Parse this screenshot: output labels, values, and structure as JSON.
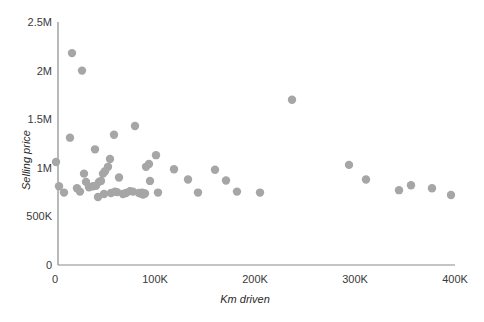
{
  "chart_data": {
    "type": "scatter",
    "title": "",
    "xlabel": "Km driven",
    "ylabel": "Selling price",
    "xlim": [
      0,
      400000
    ],
    "ylim": [
      0,
      2500000
    ],
    "grid": false,
    "legend": null,
    "marker_color": "#a6a6a6",
    "axis_color": "#8a8a8a",
    "xticks": [
      {
        "value": 0,
        "label": "0"
      },
      {
        "value": 100000,
        "label": "100K"
      },
      {
        "value": 200000,
        "label": "200K"
      },
      {
        "value": 300000,
        "label": "300K"
      },
      {
        "value": 400000,
        "label": "400K"
      }
    ],
    "yticks": [
      {
        "value": 0,
        "label": "0"
      },
      {
        "value": 500000,
        "label": "500K"
      },
      {
        "value": 1000000,
        "label": "1M"
      },
      {
        "value": 1500000,
        "label": "1.5M"
      },
      {
        "value": 2000000,
        "label": "2M"
      },
      {
        "value": 2500000,
        "label": "2.5M"
      }
    ],
    "points": [
      {
        "x": 1000,
        "y": 1060000
      },
      {
        "x": 4000,
        "y": 810000
      },
      {
        "x": 9000,
        "y": 745000
      },
      {
        "x": 17000,
        "y": 2180000
      },
      {
        "x": 15000,
        "y": 1310000
      },
      {
        "x": 27000,
        "y": 2000000
      },
      {
        "x": 22000,
        "y": 790000
      },
      {
        "x": 25000,
        "y": 755000
      },
      {
        "x": 29000,
        "y": 940000
      },
      {
        "x": 31000,
        "y": 855000
      },
      {
        "x": 34000,
        "y": 800000
      },
      {
        "x": 38000,
        "y": 810000
      },
      {
        "x": 41000,
        "y": 815000
      },
      {
        "x": 40000,
        "y": 1190000
      },
      {
        "x": 44000,
        "y": 855000
      },
      {
        "x": 46000,
        "y": 865000
      },
      {
        "x": 43000,
        "y": 700000
      },
      {
        "x": 48000,
        "y": 940000
      },
      {
        "x": 50000,
        "y": 965000
      },
      {
        "x": 49000,
        "y": 730000
      },
      {
        "x": 53000,
        "y": 1010000
      },
      {
        "x": 55000,
        "y": 1090000
      },
      {
        "x": 56000,
        "y": 740000
      },
      {
        "x": 60000,
        "y": 755000
      },
      {
        "x": 62000,
        "y": 750000
      },
      {
        "x": 64000,
        "y": 900000
      },
      {
        "x": 59000,
        "y": 1340000
      },
      {
        "x": 68000,
        "y": 730000
      },
      {
        "x": 71000,
        "y": 740000
      },
      {
        "x": 75000,
        "y": 760000
      },
      {
        "x": 78000,
        "y": 755000
      },
      {
        "x": 80000,
        "y": 1430000
      },
      {
        "x": 84000,
        "y": 740000
      },
      {
        "x": 86000,
        "y": 735000
      },
      {
        "x": 87000,
        "y": 745000
      },
      {
        "x": 88000,
        "y": 725000
      },
      {
        "x": 90000,
        "y": 735000
      },
      {
        "x": 91000,
        "y": 1010000
      },
      {
        "x": 94000,
        "y": 1040000
      },
      {
        "x": 95000,
        "y": 865000
      },
      {
        "x": 101000,
        "y": 1130000
      },
      {
        "x": 103000,
        "y": 745000
      },
      {
        "x": 119000,
        "y": 985000
      },
      {
        "x": 133000,
        "y": 880000
      },
      {
        "x": 143000,
        "y": 745000
      },
      {
        "x": 160000,
        "y": 980000
      },
      {
        "x": 171000,
        "y": 870000
      },
      {
        "x": 182000,
        "y": 755000
      },
      {
        "x": 205000,
        "y": 745000
      },
      {
        "x": 237000,
        "y": 1700000
      },
      {
        "x": 294000,
        "y": 1030000
      },
      {
        "x": 311000,
        "y": 880000
      },
      {
        "x": 344000,
        "y": 770000
      },
      {
        "x": 356000,
        "y": 820000
      },
      {
        "x": 377000,
        "y": 790000
      },
      {
        "x": 396000,
        "y": 720000
      }
    ]
  }
}
